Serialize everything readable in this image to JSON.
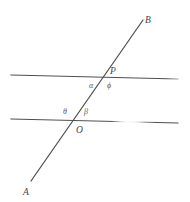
{
  "figure": {
    "background_color": "#ffffff",
    "line_color": "#4f4f4f",
    "label_color": "#4a4a4a",
    "width": 190,
    "height": 202,
    "points": {
      "A": {
        "label": "A",
        "x": 31,
        "y": 181,
        "text_x": 23,
        "text_y": 188
      },
      "B": {
        "label": "B",
        "x": 143,
        "y": 20,
        "text_x": 145,
        "text_y": 16
      },
      "O": {
        "label": "O",
        "x": 75,
        "y": 122,
        "text_x": 76,
        "text_y": 126
      },
      "P": {
        "label": "P",
        "x": 106,
        "y": 77,
        "text_x": 110,
        "text_y": 67
      }
    },
    "angles": [
      {
        "name": "alpha",
        "label": "α",
        "at_point": "P",
        "position": "below-left",
        "text_x": 89,
        "text_y": 82
      },
      {
        "name": "phi",
        "label": "ϕ",
        "at_point": "P",
        "position": "below-right",
        "text_x": 107,
        "text_y": 82
      },
      {
        "name": "theta",
        "label": "θ",
        "at_point": "O",
        "position": "above-left",
        "text_x": 63,
        "text_y": 108
      },
      {
        "name": "beta",
        "label": "β",
        "at_point": "O",
        "position": "above-right",
        "text_x": 84,
        "text_y": 108
      }
    ],
    "lines": {
      "upper_parallel": {
        "name": "upper-horizontal-line",
        "x1": 11,
        "y1": 75,
        "x2": 178,
        "y2": 79
      },
      "lower_parallel": {
        "name": "lower-horizontal-line",
        "x1": 11,
        "y1": 119,
        "x2": 178,
        "y2": 123,
        "fade_start": 118,
        "fade_end": 142
      },
      "transversal": {
        "name": "transversal-line",
        "x1": 31,
        "y1": 181,
        "x2": 143,
        "y2": 20
      }
    }
  }
}
